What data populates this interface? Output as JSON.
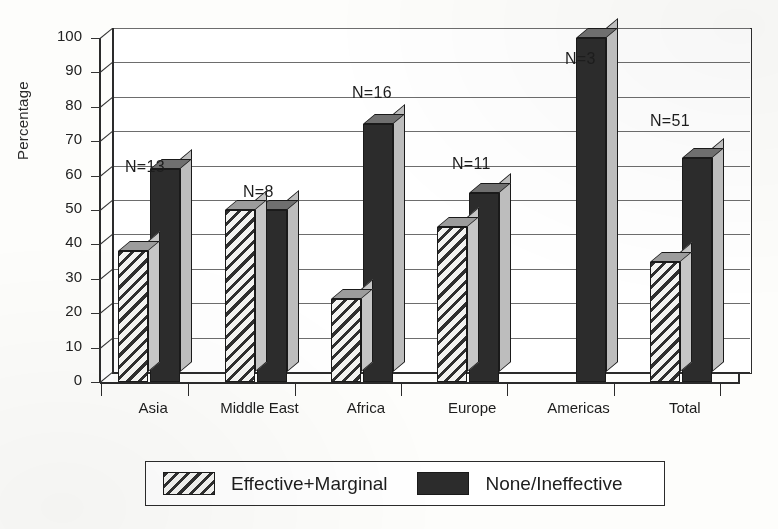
{
  "chart_data": {
    "type": "bar",
    "title": "",
    "xlabel": "",
    "ylabel": "Percentage",
    "ylim": [
      0,
      100
    ],
    "ytick_step": 10,
    "yticks": [
      "100",
      "90",
      "80",
      "70",
      "60",
      "50",
      "40",
      "30",
      "20",
      "10",
      "0"
    ],
    "grid": true,
    "legend_position": "bottom",
    "style": "3d-grouped-bar",
    "categories": [
      "Asia",
      "Middle East",
      "Africa",
      "Europe",
      "Americas",
      "Total"
    ],
    "series": [
      {
        "name": "Effective+Marginal",
        "pattern": "diagonal-hatch",
        "color": "#f3f3f1",
        "values": [
          38,
          50,
          24,
          45,
          0,
          35
        ]
      },
      {
        "name": "None/Ineffective",
        "pattern": "solid",
        "color": "#2c2c2c",
        "values": [
          62,
          50,
          75,
          55,
          100,
          65
        ]
      }
    ],
    "annotations": [
      {
        "category": "Asia",
        "text": "N=13"
      },
      {
        "category": "Middle East",
        "text": "N=8"
      },
      {
        "category": "Africa",
        "text": "N=16"
      },
      {
        "category": "Europe",
        "text": "N=11"
      },
      {
        "category": "Americas",
        "text": "N=3"
      },
      {
        "category": "Total",
        "text": "N=51"
      }
    ]
  },
  "legend": {
    "items": [
      {
        "label": "Effective+Marginal",
        "swatch": "hatch-swatch"
      },
      {
        "label": "None/Ineffective",
        "swatch": "dark-swatch"
      }
    ]
  }
}
